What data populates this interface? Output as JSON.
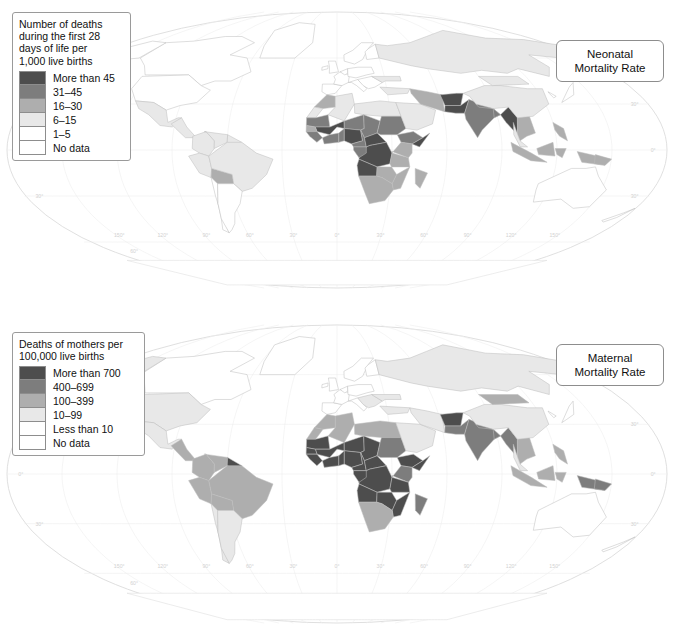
{
  "figure": {
    "kind": "two-panel world choropleth map",
    "background": "#ffffff"
  },
  "panels": [
    {
      "id": "neonatal",
      "title": "Neonatal\nMortality Rate",
      "legend": {
        "title": "Number of deaths\nduring the first 28\ndays of life per\n1,000 live births",
        "items": [
          {
            "label": "More than 45",
            "color": "#4d4d4d"
          },
          {
            "label": "31–45",
            "color": "#7d7d7d"
          },
          {
            "label": "16–30",
            "color": "#aeaeae"
          },
          {
            "label": "6–15",
            "color": "#e8e8e8"
          },
          {
            "label": "1–5",
            "color": "#ffffff"
          },
          {
            "label": "No data",
            "color": "#ffffff"
          }
        ]
      }
    },
    {
      "id": "maternal",
      "title": "Maternal\nMortality Rate",
      "legend": {
        "title": "Deaths of mothers per\n100,000 live births",
        "items": [
          {
            "label": "More than 700",
            "color": "#4d4d4d"
          },
          {
            "label": "400–699",
            "color": "#7d7d7d"
          },
          {
            "label": "100–399",
            "color": "#aeaeae"
          },
          {
            "label": "10–99",
            "color": "#e8e8e8"
          },
          {
            "label": "Less than 10",
            "color": "#ffffff"
          },
          {
            "label": "No data",
            "color": "#ffffff"
          }
        ]
      }
    }
  ],
  "graticule": {
    "longitude_labels": [
      "150°",
      "120°",
      "90°",
      "60°",
      "30°",
      "0°",
      "30°",
      "60°",
      "90°",
      "120°",
      "150°"
    ],
    "latitude_labels": [
      "60°",
      "30°",
      "0°",
      "30°",
      "60°"
    ],
    "label_color": "#d2d2d2"
  },
  "chart_data": {
    "type": "map",
    "projection": "Robinson / elliptical world",
    "maps": [
      {
        "name": "Neonatal Mortality Rate",
        "unit": "deaths during first 28 days of life per 1,000 live births",
        "classes": [
          "More than 45",
          "31–45",
          "16–30",
          "6–15",
          "1–5",
          "No data"
        ],
        "regions": [
          {
            "name": "Canada",
            "class": "1–5"
          },
          {
            "name": "United States",
            "class": "1–5"
          },
          {
            "name": "Mexico",
            "class": "6–15"
          },
          {
            "name": "Central America",
            "class": "6–15"
          },
          {
            "name": "Brazil",
            "class": "6–15"
          },
          {
            "name": "Bolivia",
            "class": "16–30"
          },
          {
            "name": "Argentina",
            "class": "1–5"
          },
          {
            "name": "Chile",
            "class": "1–5"
          },
          {
            "name": "Western Europe",
            "class": "1–5"
          },
          {
            "name": "Eastern Europe",
            "class": "1–5"
          },
          {
            "name": "Russia",
            "class": "6–15"
          },
          {
            "name": "North Africa",
            "class": "16–30"
          },
          {
            "name": "Mali",
            "class": "More than 45"
          },
          {
            "name": "Nigeria",
            "class": "More than 45"
          },
          {
            "name": "Central African Republic",
            "class": "More than 45"
          },
          {
            "name": "Democratic Republic of the Congo",
            "class": "More than 45"
          },
          {
            "name": "Angola",
            "class": "More than 45"
          },
          {
            "name": "Somalia",
            "class": "More than 45"
          },
          {
            "name": "Sub-Saharan Africa (general)",
            "class": "31–45"
          },
          {
            "name": "Southern Africa",
            "class": "16–30"
          },
          {
            "name": "Afghanistan",
            "class": "More than 45"
          },
          {
            "name": "Pakistan",
            "class": "More than 45"
          },
          {
            "name": "India",
            "class": "31–45"
          },
          {
            "name": "Myanmar",
            "class": "More than 45"
          },
          {
            "name": "China",
            "class": "6–15"
          },
          {
            "name": "Southeast Asia",
            "class": "16–30"
          },
          {
            "name": "Indonesia",
            "class": "16–30"
          },
          {
            "name": "Papua New Guinea",
            "class": "16–30"
          },
          {
            "name": "Australia",
            "class": "1–5"
          }
        ]
      },
      {
        "name": "Maternal Mortality Rate",
        "unit": "deaths of mothers per 100,000 live births",
        "classes": [
          "More than 700",
          "400–699",
          "100–399",
          "10–99",
          "Less than 10",
          "No data"
        ],
        "regions": [
          {
            "name": "Canada",
            "class": "Less than 10"
          },
          {
            "name": "United States",
            "class": "10–99"
          },
          {
            "name": "Mexico",
            "class": "10–99"
          },
          {
            "name": "Central America",
            "class": "100–399"
          },
          {
            "name": "Brazil",
            "class": "100–399"
          },
          {
            "name": "Bolivia",
            "class": "100–399"
          },
          {
            "name": "Peru",
            "class": "100–399"
          },
          {
            "name": "Argentina",
            "class": "10–99"
          },
          {
            "name": "Chile",
            "class": "10–99"
          },
          {
            "name": "Western Europe",
            "class": "Less than 10"
          },
          {
            "name": "Eastern Europe",
            "class": "10–99"
          },
          {
            "name": "Russia",
            "class": "10–99"
          },
          {
            "name": "North Africa",
            "class": "100–399"
          },
          {
            "name": "West Africa",
            "class": "More than 700"
          },
          {
            "name": "Nigeria",
            "class": "More than 700"
          },
          {
            "name": "Chad",
            "class": "More than 700"
          },
          {
            "name": "Central African Republic",
            "class": "More than 700"
          },
          {
            "name": "Democratic Republic of the Congo",
            "class": "More than 700"
          },
          {
            "name": "Angola",
            "class": "More than 700"
          },
          {
            "name": "Somalia",
            "class": "More than 700"
          },
          {
            "name": "Ethiopia",
            "class": "More than 700"
          },
          {
            "name": "Sudan",
            "class": "400–699"
          },
          {
            "name": "Southern Africa",
            "class": "100–399"
          },
          {
            "name": "Afghanistan",
            "class": "More than 700"
          },
          {
            "name": "Pakistan",
            "class": "400–699"
          },
          {
            "name": "India",
            "class": "400–699"
          },
          {
            "name": "Myanmar",
            "class": "400–699"
          },
          {
            "name": "China",
            "class": "10–99"
          },
          {
            "name": "Indonesia",
            "class": "100–399"
          },
          {
            "name": "Papua New Guinea",
            "class": "400–699"
          },
          {
            "name": "Australia",
            "class": "Less than 10"
          }
        ]
      }
    ]
  }
}
